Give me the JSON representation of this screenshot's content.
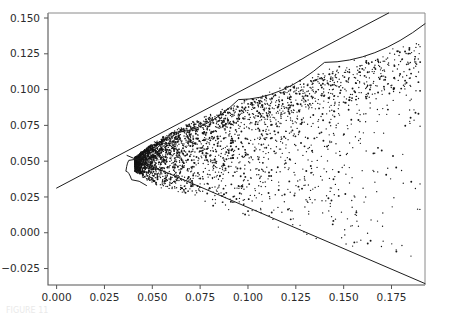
{
  "figure": {
    "title": "",
    "caption_fragment": "FIGURE 11",
    "background_color": "#ffffff",
    "point_color": "#141414",
    "line_color": "#1d1d1d",
    "axis_color": "#555555"
  },
  "chart_data": {
    "type": "scatter",
    "title": "",
    "xlabel": "",
    "ylabel": "",
    "xlim": [
      -0.0045,
      0.1925
    ],
    "ylim": [
      -0.0365,
      0.1535
    ],
    "grid": false,
    "legend": null,
    "x_ticks": [
      0.0,
      0.025,
      0.05,
      0.075,
      0.1,
      0.125,
      0.15,
      0.175
    ],
    "x_tick_labels": [
      "0.000",
      "0.025",
      "0.050",
      "0.075",
      "0.100",
      "0.125",
      "0.150",
      "0.175"
    ],
    "y_ticks": [
      -0.025,
      0.0,
      0.025,
      0.05,
      0.075,
      0.1,
      0.125,
      0.15
    ],
    "y_tick_labels": [
      "-0.025",
      "0.000",
      "0.025",
      "0.050",
      "0.075",
      "0.100",
      "0.125",
      "0.150"
    ],
    "n_points": 4200,
    "marker_size_px": 1.3,
    "cloud_description": "dense rightward-opening parabolic horn, apex near (0.040, 0.048), widening toward larger x; density highest along upper boundary and near apex, thinning into the interior",
    "apex": [
      0.04,
      0.048
    ],
    "overlays": [
      {
        "name": "upper-tangent-line",
        "type": "line",
        "points": [
          [
            0.0,
            0.0312
          ],
          [
            0.1735,
            0.1535
          ]
        ]
      },
      {
        "name": "lower-boundary-line",
        "type": "line",
        "points": [
          [
            0.0368,
            0.054
          ],
          [
            0.1925,
            -0.0355
          ]
        ]
      },
      {
        "name": "upper-envelope-curve",
        "type": "curve",
        "points": [
          [
            0.0378,
            0.0505
          ],
          [
            0.06,
            0.07
          ],
          [
            0.095,
            0.093
          ],
          [
            0.14,
            0.119
          ],
          [
            0.1925,
            0.146
          ]
        ]
      },
      {
        "name": "apex-nose-curve",
        "type": "curve",
        "points": [
          [
            0.0378,
            0.0505
          ],
          [
            0.0362,
            0.043
          ],
          [
            0.0392,
            0.037
          ],
          [
            0.047,
            0.033
          ]
        ]
      }
    ],
    "series": [
      {
        "name": "data-cloud",
        "marker": "point",
        "color": "#141414",
        "x": [
          0.041,
          0.043,
          0.044,
          0.046,
          0.047,
          0.048,
          0.05,
          0.051,
          0.053,
          0.054,
          0.056,
          0.057,
          0.059,
          0.06,
          0.062,
          0.063,
          0.065,
          0.066,
          0.068,
          0.069,
          0.071,
          0.072,
          0.074,
          0.075,
          0.077,
          0.078,
          0.08,
          0.082,
          0.084,
          0.086,
          0.088,
          0.09,
          0.092,
          0.095,
          0.098,
          0.101,
          0.104,
          0.107,
          0.11,
          0.114,
          0.118,
          0.122,
          0.126,
          0.13,
          0.134,
          0.139,
          0.144,
          0.149,
          0.155,
          0.161,
          0.167,
          0.173,
          0.179,
          0.185,
          0.19
        ],
        "y_upper": [
          0.0525,
          0.0545,
          0.056,
          0.0578,
          0.059,
          0.06,
          0.0618,
          0.0628,
          0.0645,
          0.0653,
          0.0668,
          0.0676,
          0.069,
          0.0697,
          0.071,
          0.0717,
          0.073,
          0.0736,
          0.0748,
          0.0754,
          0.0766,
          0.0772,
          0.0784,
          0.0789,
          0.08,
          0.0806,
          0.0817,
          0.0828,
          0.0839,
          0.0849,
          0.086,
          0.0871,
          0.0881,
          0.0897,
          0.0912,
          0.0928,
          0.0943,
          0.0957,
          0.0972,
          0.0991,
          0.101,
          0.1029,
          0.1048,
          0.1066,
          0.1084,
          0.1106,
          0.1127,
          0.1149,
          0.1174,
          0.12,
          0.1225,
          0.125,
          0.1274,
          0.1299,
          0.132
        ],
        "y_lower": [
          0.043,
          0.041,
          0.0396,
          0.038,
          0.037,
          0.036,
          0.0346,
          0.0338,
          0.0326,
          0.0319,
          0.0308,
          0.0302,
          0.0291,
          0.0286,
          0.0276,
          0.027,
          0.026,
          0.0255,
          0.0245,
          0.024,
          0.023,
          0.0225,
          0.0215,
          0.0211,
          0.0201,
          0.0197,
          0.0188,
          0.0179,
          0.017,
          0.0161,
          0.0152,
          0.0143,
          0.0135,
          0.0122,
          0.0109,
          0.0097,
          0.0084,
          0.0072,
          0.0059,
          0.0043,
          0.0027,
          0.0011,
          -0.0005,
          -0.0021,
          -0.0037,
          -0.0057,
          -0.0076,
          -0.0096,
          -0.012,
          -0.0144,
          -0.0168,
          -0.0192,
          -0.0216,
          -0.024,
          -0.0258
        ]
      }
    ]
  }
}
